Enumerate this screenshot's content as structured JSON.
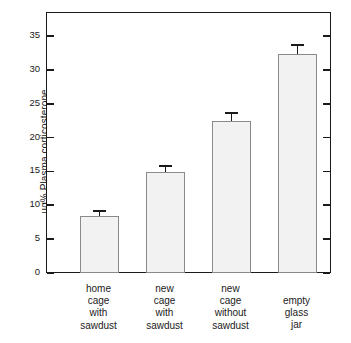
{
  "chart_data": {
    "type": "bar",
    "title": "",
    "subtitle": "",
    "xlabel": "",
    "ylabel": "µg% Plasma corticosterone",
    "categories": [
      "home\ncage\nwith\nsawdust",
      "new\ncage\nwith\nsawdust",
      "new\ncage\nwithout\nsawdust",
      "empty\nglass\njar"
    ],
    "categories_flat": [
      "home cage with sawdust",
      "new cage with sawdust",
      "new cage without sawdust",
      "empty glass jar"
    ],
    "values": [
      8.4,
      14.9,
      22.4,
      32.4
    ],
    "errors": [
      0.8,
      0.9,
      1.2,
      1.2
    ],
    "ylim": [
      0,
      38.5
    ],
    "yticks": [
      0,
      5,
      10,
      15,
      20,
      25,
      30,
      35
    ],
    "ytick_labels": [
      "0",
      "5",
      "10",
      "15",
      "20",
      "25",
      "30",
      "35"
    ],
    "grid": false,
    "legend": false,
    "legend_position": "none",
    "bar_fill_color": "#f2f2f2",
    "bar_edge_color": "#8a8a8a",
    "axis_color": "#1a1a1a",
    "error_bar_color": "#1a1a1a",
    "background_color": "#ffffff"
  }
}
